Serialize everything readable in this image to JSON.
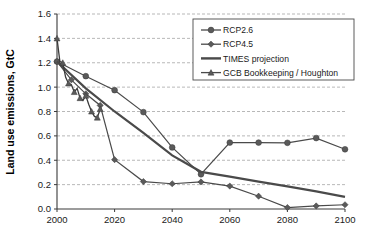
{
  "chart_data": {
    "type": "line",
    "title": "",
    "xlabel": "",
    "ylabel": "Land use emissions, GtC",
    "xlim": [
      2000,
      2100
    ],
    "ylim": [
      0.0,
      1.6
    ],
    "ytick_step": 0.2,
    "xtick_step": 20,
    "grid": "horizontal-dashed",
    "legend_position": "top-right",
    "xticks": [
      "2000",
      "2020",
      "2040",
      "2060",
      "2080",
      "2100"
    ],
    "yticks": [
      "0.0",
      "0.2",
      "0.4",
      "0.6",
      "0.8",
      "1.0",
      "1.2",
      "1.4",
      "1.6"
    ],
    "series": [
      {
        "name": "RCP2.6",
        "marker": "circle",
        "x": [
          2000,
          2010,
          2020,
          2030,
          2040,
          2050,
          2060,
          2070,
          2080,
          2090,
          2100
        ],
        "values": [
          1.21,
          1.09,
          0.975,
          0.795,
          0.505,
          0.285,
          0.545,
          0.545,
          0.543,
          0.582,
          0.49
        ]
      },
      {
        "name": "RCP4.5",
        "marker": "diamond",
        "x": [
          2000,
          2005,
          2010,
          2015,
          2020,
          2030,
          2040,
          2050,
          2060,
          2070,
          2080,
          2090,
          2100
        ],
        "values": [
          1.21,
          1.06,
          0.945,
          0.85,
          0.405,
          0.225,
          0.207,
          0.222,
          0.188,
          0.105,
          0.012,
          0.025,
          0.035
        ]
      },
      {
        "name": "TIMES projection",
        "marker": "none",
        "x": [
          2000,
          2010,
          2020,
          2030,
          2040,
          2050,
          2060,
          2070,
          2080,
          2090,
          2100
        ],
        "values": [
          1.21,
          0.99,
          0.8,
          0.625,
          0.44,
          0.305,
          0.265,
          0.225,
          0.185,
          0.145,
          0.1
        ]
      },
      {
        "name": "GCB Bookkeeping / Houghton",
        "marker": "triangle",
        "x": [
          2000,
          2001,
          2002,
          2003,
          2004,
          2005,
          2006,
          2007,
          2008,
          2009,
          2010,
          2011,
          2012,
          2013,
          2014,
          2015
        ],
        "values": [
          1.4,
          1.21,
          1.2,
          1.08,
          1.03,
          1.02,
          0.96,
          0.99,
          0.91,
          0.89,
          0.93,
          0.86,
          0.8,
          0.76,
          0.75,
          0.82
        ]
      }
    ],
    "legend": [
      {
        "label": "RCP2.6",
        "marker": "circle"
      },
      {
        "label": "RCP4.5",
        "marker": "diamond"
      },
      {
        "label": "TIMES projection",
        "marker": "none"
      },
      {
        "label": "GCB Bookkeeping / Houghton",
        "marker": "triangle"
      }
    ],
    "colors": {
      "line": "#4a4a4a",
      "marker": "#5a5a5a",
      "grid": "#9a9a9a",
      "axis": "#3a3a3a",
      "background": "#ffffff"
    }
  }
}
